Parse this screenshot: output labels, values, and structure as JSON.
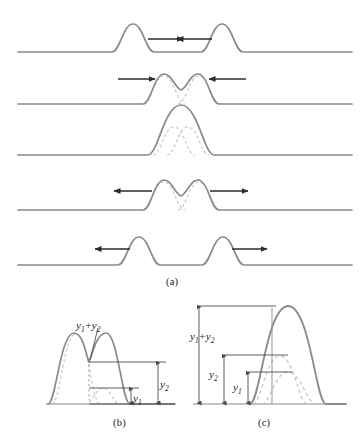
{
  "figure": {
    "stroke_colors": {
      "solid_curve": "#8a8a8a",
      "dashed_curve": "#b9b9b9",
      "arrow": "#2b2b2b",
      "measure_line": "#4a4a4a",
      "text": "#1a1a1a"
    }
  },
  "panels": [
    {
      "id": "a",
      "caption": "(a)",
      "description": "Time sequence of two pulses approaching, overlapping and separating",
      "rows": [
        {
          "index": 1,
          "baseline_y": 52,
          "pulses": [
            {
              "center_x": 133,
              "height": 28,
              "width": 30,
              "direction": "right"
            },
            {
              "center_x": 222,
              "height": 28,
              "width": 30,
              "direction": "left"
            }
          ],
          "arrows": [
            {
              "from_x": 145,
              "to_x": 180,
              "y": 39,
              "direction": "right"
            },
            {
              "from_x": 212,
              "to_x": 177,
              "y": 39,
              "direction": "left"
            }
          ],
          "dashed_components": []
        },
        {
          "index": 2,
          "baseline_y": 104,
          "pulses": [
            {
              "center_x": 163,
              "height": 28,
              "width": 30,
              "direction": "right"
            },
            {
              "center_x": 199,
              "height": 28,
              "width": 30,
              "direction": "left"
            }
          ],
          "arrows": [
            {
              "from_x": 118,
              "to_x": 152,
              "y": 79,
              "direction": "right"
            },
            {
              "from_x": 244,
              "to_x": 210,
              "y": 79,
              "direction": "left"
            }
          ],
          "dashed_components": [
            {
              "center_x": 163,
              "height": 28,
              "width": 30
            },
            {
              "center_x": 199,
              "height": 28,
              "width": 30
            }
          ]
        },
        {
          "index": 3,
          "baseline_y": 155,
          "pulses": [
            {
              "center_x": 181,
              "height": 50,
              "width": 34,
              "direction": "none"
            }
          ],
          "arrows": [],
          "dashed_components": [
            {
              "center_x": 173,
              "height": 28,
              "width": 30
            },
            {
              "center_x": 189,
              "height": 28,
              "width": 30
            }
          ]
        },
        {
          "index": 4,
          "baseline_y": 210,
          "pulses": [
            {
              "center_x": 163,
              "height": 28,
              "width": 30,
              "direction": "left"
            },
            {
              "center_x": 199,
              "height": 28,
              "width": 30,
              "direction": "right"
            }
          ],
          "arrows": [
            {
              "from_x": 152,
              "to_x": 114,
              "y": 191,
              "direction": "left"
            },
            {
              "from_x": 210,
              "to_x": 248,
              "y": 191,
              "direction": "right"
            }
          ],
          "dashed_components": [
            {
              "center_x": 163,
              "height": 28,
              "width": 30
            },
            {
              "center_x": 199,
              "height": 28,
              "width": 30
            }
          ]
        },
        {
          "index": 5,
          "baseline_y": 265,
          "pulses": [
            {
              "center_x": 139,
              "height": 28,
              "width": 30,
              "direction": "left"
            },
            {
              "center_x": 223,
              "height": 28,
              "width": 30,
              "direction": "right"
            }
          ],
          "arrows": [
            {
              "from_x": 130,
              "to_x": 95,
              "y": 249,
              "direction": "left"
            },
            {
              "from_x": 232,
              "to_x": 267,
              "y": 249,
              "direction": "right"
            }
          ],
          "dashed_components": []
        }
      ]
    },
    {
      "id": "b",
      "caption": "(b)",
      "description": "Partial overlap: resultant is sum of the two displacements",
      "baseline_y": 404,
      "labels": {
        "sum": {
          "y1": "y",
          "sub1": "1",
          "plus": "+",
          "y2": "y",
          "sub2": "2",
          "text": "y1 + y2"
        },
        "y2": {
          "base": "y",
          "sub": "2",
          "text": "y2"
        },
        "y1": {
          "base": "y",
          "sub": "1",
          "text": "y1"
        }
      },
      "measures": [
        {
          "name": "y2",
          "top_y": 362,
          "bottom_y": 404,
          "x": 166
        },
        {
          "name": "y1",
          "top_y": 388,
          "bottom_y": 404,
          "x": 139
        }
      ]
    },
    {
      "id": "c",
      "caption": "(c)",
      "description": "Maximum overlap: resultant amplitude equals y1 plus y2",
      "baseline_y": 404,
      "labels": {
        "sum": {
          "y1": "y",
          "sub1": "1",
          "plus": "+",
          "y2": "y",
          "sub2": "2",
          "text": "y1 + y2"
        },
        "y2": {
          "base": "y",
          "sub": "2",
          "text": "y2"
        },
        "y1": {
          "base": "y",
          "sub": "1",
          "text": "y1"
        }
      },
      "measures": [
        {
          "name": "y1+y2",
          "top_y": 306,
          "bottom_y": 404,
          "x": 199
        },
        {
          "name": "y2",
          "top_y": 355,
          "bottom_y": 404,
          "x": 224
        },
        {
          "name": "y1",
          "top_y": 372,
          "bottom_y": 404,
          "x": 248
        }
      ]
    }
  ]
}
